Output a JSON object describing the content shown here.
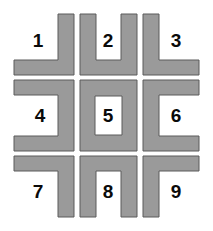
{
  "figure": {
    "kind": "shape-grid-puzzle",
    "width": 213,
    "height": 231,
    "background_color": "#ffffff",
    "shape_fill_color": "#9a9a9a",
    "shape_stroke_color": "#5a5a5a",
    "label_color": "#0a0a0a"
  },
  "grid": {
    "rows": 3,
    "columns": 3,
    "cell_count": 9
  },
  "cells": [
    {
      "label": "1",
      "shape_name": "corner-bottom-right-L",
      "description": "vertical bar on right joined to horizontal bar along bottom",
      "label_x": 38,
      "label_y": 41,
      "path": "M 58 14 L 74 14 L 74 75 L 14 75 L 14 60 L 58 60 Z"
    },
    {
      "label": "2",
      "shape_name": "u-shape-open-top",
      "description": "U shape opening upward",
      "label_x": 108,
      "label_y": 41,
      "path": "M 80 14 L 96 14 L 96 60 L 121 60 L 121 14 L 137 14 L 137 75 L 80 75 Z"
    },
    {
      "label": "3",
      "shape_name": "corner-bottom-left-L",
      "description": "vertical bar on left joined to horizontal bar along bottom",
      "label_x": 176,
      "label_y": 41,
      "path": "M 143 14 L 159 14 L 159 60 L 199 60 L 199 75 L 143 75 Z"
    },
    {
      "label": "4",
      "shape_name": "c-shape-open-left",
      "description": "bracket opening to the left",
      "label_x": 40,
      "label_y": 116,
      "path": "M 14 80 L 74 80 L 74 151 L 14 151 L 14 136 L 58 136 L 58 95 L 14 95 Z"
    },
    {
      "label": "5",
      "shape_name": "closed-square-ring",
      "description": "closed rectangular ring with hollow centre",
      "label_x": 108,
      "label_y": 116,
      "path": "M 80 80 L 137 80 L 137 151 L 80 151 Z M 95 96 L 95 135 L 122 135 L 122 96 Z"
    },
    {
      "label": "6",
      "shape_name": "c-shape-open-right",
      "description": "bracket opening to the right",
      "label_x": 176,
      "label_y": 116,
      "path": "M 199 80 L 199 95 L 159 95 L 159 136 L 199 136 L 199 151 L 143 151 L 143 80 Z"
    },
    {
      "label": "7",
      "shape_name": "corner-top-left-flag",
      "description": "horizontal bar along top joined to vertical bar on right",
      "label_x": 38,
      "label_y": 192,
      "path": "M 14 156 L 74 156 L 74 217 L 58 217 L 58 171 L 14 171 Z"
    },
    {
      "label": "8",
      "shape_name": "inverted-u-open-bottom",
      "description": "inverted U opening downward",
      "label_x": 108,
      "label_y": 192,
      "path": "M 80 156 L 137 156 L 137 217 L 121 217 L 121 171 L 96 171 L 96 217 L 80 217 Z"
    },
    {
      "label": "9",
      "shape_name": "corner-top-right-flag",
      "description": "horizontal bar along top joined to vertical bar on left",
      "label_x": 176,
      "label_y": 192,
      "path": "M 143 156 L 199 156 L 199 171 L 159 171 L 159 217 L 143 217 Z"
    }
  ]
}
